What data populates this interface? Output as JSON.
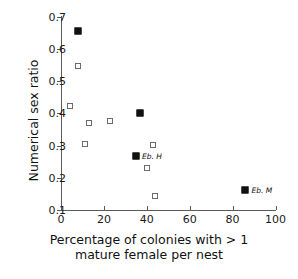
{
  "chart_data": {
    "type": "scatter",
    "title": "",
    "xlabel_line1": "Percentage of colonies with > 1",
    "xlabel_line2": "mature female per nest",
    "ylabel": "Numerical sex ratio",
    "xlim": [
      0,
      100
    ],
    "ylim": [
      0.1,
      0.7
    ],
    "xticks": [
      0,
      20,
      40,
      60,
      80,
      100
    ],
    "xtick_labels": [
      "0",
      "20",
      "40",
      "60",
      "80",
      "100"
    ],
    "yticks": [
      0.1,
      0.2,
      0.3,
      0.4,
      0.5,
      0.6,
      0.7
    ],
    "ytick_labels": [
      "0.1",
      "0.2",
      "0.3",
      "0.4",
      "0.5",
      "0.6",
      "0.7"
    ],
    "grid": false,
    "legend": "none",
    "series": [
      {
        "name": "filled",
        "marker": "filled-square",
        "color": "#111111",
        "points": [
          {
            "x": 8,
            "y": 0.655,
            "label": ""
          },
          {
            "x": 37,
            "y": 0.4,
            "label": ""
          },
          {
            "x": 35,
            "y": 0.267,
            "label": "Eb. H"
          },
          {
            "x": 86,
            "y": 0.162,
            "label": "Eb. M"
          }
        ]
      },
      {
        "name": "open",
        "marker": "open-square",
        "color": "#6b6b6b",
        "points": [
          {
            "x": 8,
            "y": 0.548,
            "label": ""
          },
          {
            "x": 4,
            "y": 0.423,
            "label": ""
          },
          {
            "x": 13,
            "y": 0.37,
            "label": ""
          },
          {
            "x": 23,
            "y": 0.377,
            "label": ""
          },
          {
            "x": 11,
            "y": 0.305,
            "label": ""
          },
          {
            "x": 43,
            "y": 0.301,
            "label": ""
          },
          {
            "x": 40,
            "y": 0.231,
            "label": ""
          },
          {
            "x": 44,
            "y": 0.142,
            "label": ""
          }
        ]
      }
    ],
    "annotations": [
      {
        "text": "Eb. H",
        "x": 35,
        "y": 0.267
      },
      {
        "text": "Eb. M",
        "x": 86,
        "y": 0.162
      }
    ]
  }
}
